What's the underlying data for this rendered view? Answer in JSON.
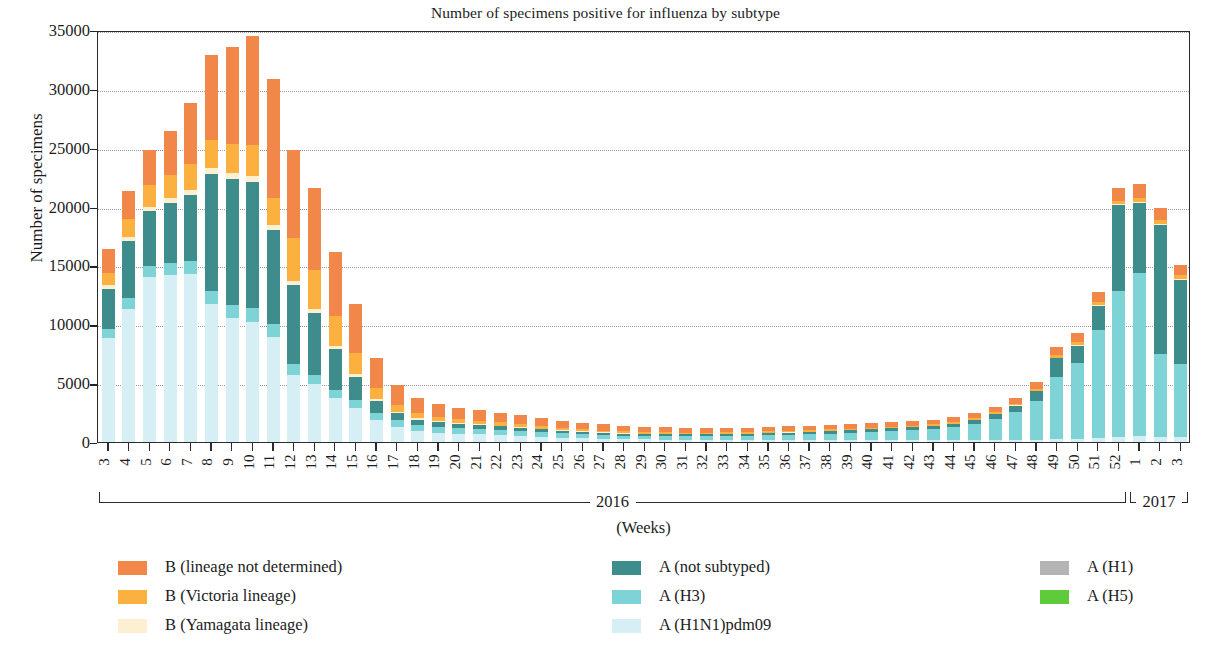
{
  "chart_data": {
    "type": "bar",
    "subtype": "stacked-bar",
    "title": "Number of specimens positive for influenza by subtype",
    "xlabel": "(Weeks)",
    "ylabel": "Number of specimens",
    "ylim": [
      0,
      35000
    ],
    "ytick_values": [
      0,
      5000,
      10000,
      15000,
      20000,
      25000,
      30000,
      35000
    ],
    "ytick_labels": [
      "0",
      "5000",
      "10000",
      "15000",
      "20000",
      "25000",
      "30000",
      "35000"
    ],
    "grid": "horizontal-dotted",
    "legend_position": "below-plot-three-columns",
    "stack_order_bottom_to_top": [
      "A (H1N1)pdm09",
      "A (H3)",
      "A (H1)",
      "A (H5)",
      "A (not subtyped)",
      "B (Yamagata lineage)",
      "B (Victoria lineage)",
      "B (lineage not determined)"
    ],
    "year_groups": [
      {
        "label": "2016",
        "start_index": 0,
        "end_index": 49
      },
      {
        "label": "2017",
        "start_index": 50,
        "end_index": 52
      }
    ],
    "categories": [
      "3",
      "4",
      "5",
      "6",
      "7",
      "8",
      "9",
      "10",
      "11",
      "12",
      "13",
      "14",
      "15",
      "16",
      "17",
      "18",
      "19",
      "20",
      "21",
      "22",
      "23",
      "24",
      "25",
      "26",
      "27",
      "28",
      "29",
      "30",
      "31",
      "32",
      "33",
      "34",
      "35",
      "36",
      "37",
      "38",
      "39",
      "40",
      "41",
      "42",
      "43",
      "44",
      "45",
      "46",
      "47",
      "48",
      "49",
      "50",
      "51",
      "52",
      "1",
      "2",
      "3"
    ],
    "series": [
      {
        "name": "A (H1N1)pdm09",
        "color": "#d6eff5",
        "values": [
          8800,
          11300,
          14000,
          14200,
          14300,
          11700,
          10500,
          10200,
          8900,
          5700,
          4900,
          3700,
          2900,
          1900,
          1300,
          950,
          800,
          700,
          650,
          600,
          520,
          450,
          380,
          320,
          280,
          250,
          230,
          210,
          200,
          190,
          185,
          180,
          175,
          170,
          165,
          160,
          155,
          150,
          150,
          150,
          150,
          155,
          160,
          170,
          180,
          200,
          230,
          280,
          340,
          420,
          480,
          450,
          400
        ]
      },
      {
        "name": "A (H3)",
        "color": "#7ed3d6",
        "values": [
          800,
          900,
          950,
          1000,
          1050,
          1100,
          1150,
          1200,
          1100,
          900,
          800,
          700,
          650,
          600,
          550,
          500,
          480,
          460,
          440,
          420,
          400,
          380,
          350,
          330,
          310,
          300,
          290,
          280,
          290,
          300,
          320,
          350,
          400,
          450,
          500,
          560,
          620,
          700,
          780,
          860,
          950,
          1100,
          1400,
          1800,
          2400,
          3300,
          5300,
          6400,
          9200,
          12400,
          13900,
          7000,
          6200
        ]
      },
      {
        "name": "A (H1)",
        "color": "#b3b3b3",
        "values": [
          0,
          0,
          0,
          0,
          0,
          0,
          0,
          0,
          0,
          0,
          0,
          0,
          0,
          0,
          0,
          0,
          0,
          0,
          0,
          0,
          0,
          0,
          0,
          0,
          0,
          0,
          0,
          0,
          0,
          0,
          0,
          0,
          0,
          0,
          0,
          0,
          0,
          0,
          0,
          0,
          0,
          0,
          0,
          0,
          0,
          0,
          0,
          0,
          0,
          0,
          0,
          0,
          0
        ]
      },
      {
        "name": "A (H5)",
        "color": "#5ecb3a",
        "values": [
          0,
          0,
          0,
          0,
          0,
          0,
          0,
          0,
          0,
          0,
          0,
          0,
          0,
          0,
          0,
          0,
          0,
          0,
          0,
          0,
          0,
          0,
          0,
          0,
          0,
          0,
          0,
          0,
          0,
          0,
          0,
          0,
          0,
          0,
          0,
          0,
          0,
          0,
          0,
          0,
          0,
          0,
          0,
          0,
          0,
          0,
          0,
          0,
          0,
          0,
          0,
          0,
          0
        ]
      },
      {
        "name": "A (not subtyped)",
        "color": "#3f8c8c",
        "values": [
          3400,
          4900,
          4650,
          5100,
          5600,
          10000,
          10700,
          10700,
          8000,
          6700,
          5300,
          3500,
          2000,
          1000,
          600,
          450,
          400,
          350,
          330,
          300,
          280,
          250,
          220,
          200,
          180,
          170,
          160,
          150,
          150,
          150,
          150,
          160,
          170,
          180,
          190,
          200,
          210,
          220,
          230,
          240,
          250,
          280,
          320,
          400,
          500,
          800,
          1600,
          1500,
          2000,
          7300,
          5900,
          11000,
          7200
        ]
      },
      {
        "name": "B (Yamagata lineage)",
        "color": "#fdf0d2",
        "values": [
          300,
          350,
          400,
          420,
          450,
          480,
          500,
          500,
          450,
          350,
          300,
          250,
          200,
          150,
          120,
          100,
          90,
          80,
          75,
          70,
          65,
          60,
          55,
          50,
          45,
          40,
          38,
          36,
          35,
          34,
          33,
          32,
          31,
          30,
          30,
          30,
          30,
          30,
          30,
          30,
          30,
          32,
          34,
          36,
          40,
          45,
          50,
          60,
          70,
          80,
          90,
          85,
          80
        ]
      },
      {
        "name": "B (Victoria lineage)",
        "color": "#fbb040",
        "values": [
          1100,
          1500,
          1800,
          2000,
          2200,
          2400,
          2500,
          2600,
          2300,
          3700,
          3300,
          2600,
          1800,
          900,
          600,
          450,
          380,
          330,
          300,
          280,
          250,
          230,
          200,
          180,
          160,
          150,
          140,
          135,
          130,
          128,
          126,
          125,
          124,
          123,
          122,
          121,
          120,
          120,
          120,
          120,
          120,
          125,
          130,
          140,
          150,
          170,
          200,
          230,
          260,
          300,
          330,
          310,
          290
        ]
      },
      {
        "name": "B (lineage not determined)",
        "color": "#f2874a",
        "values": [
          2000,
          2350,
          3000,
          3700,
          5200,
          7200,
          8200,
          9300,
          10100,
          7500,
          7000,
          5400,
          4200,
          2600,
          1700,
          1300,
          1100,
          980,
          900,
          830,
          760,
          700,
          620,
          570,
          520,
          480,
          450,
          430,
          410,
          400,
          390,
          380,
          375,
          370,
          370,
          370,
          370,
          370,
          370,
          380,
          390,
          400,
          420,
          450,
          500,
          570,
          700,
          800,
          900,
          1100,
          1200,
          1000,
          900
        ]
      }
    ],
    "legend_columns": [
      {
        "items": [
          {
            "label": "B (lineage not determined)",
            "color": "#f2874a"
          },
          {
            "label": "B (Victoria lineage)",
            "color": "#fbb040"
          },
          {
            "label": "B (Yamagata lineage)",
            "color": "#fdf0d2"
          }
        ]
      },
      {
        "items": [
          {
            "label": "A (not subtyped)",
            "color": "#3f8c8c"
          },
          {
            "label": "A (H3)",
            "color": "#7ed3d6"
          },
          {
            "label": "A (H1N1)pdm09",
            "color": "#d6eff5"
          }
        ]
      },
      {
        "items": [
          {
            "label": "A (H1)",
            "color": "#b3b3b3"
          },
          {
            "label": "A (H5)",
            "color": "#5ecb3a"
          }
        ]
      }
    ]
  }
}
